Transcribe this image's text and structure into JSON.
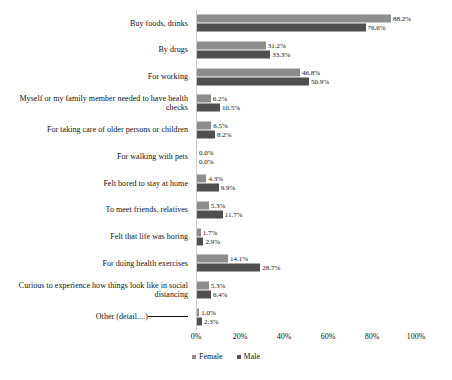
{
  "chart_data": {
    "type": "bar",
    "orientation": "horizontal",
    "title": "",
    "subtitle": "",
    "xlabel": "",
    "ylabel": "",
    "xlim": [
      0,
      100
    ],
    "xticks": [
      "0%",
      "20%",
      "40%",
      "60%",
      "80%",
      "100%"
    ],
    "xtick_values": [
      0,
      20,
      40,
      60,
      80,
      100
    ],
    "grid": false,
    "legend_position": "bottom-center",
    "value_suffix": "%",
    "categories": [
      "Other (detail....)",
      "Curious to experience how things look like in social distancing",
      "For doing health exercises",
      "Felt that life was boring",
      "To meet friends, relatives",
      "Felt bored to stay at home",
      "For walking with pets",
      "For taking care of older persons or children",
      "Myself or my family member needed to have health checks",
      "For working",
      "By drugs",
      "Buy foods, drinks"
    ],
    "series": [
      {
        "name": "Female",
        "color": "#8d8d8d",
        "values": [
          1.0,
          5.3,
          14.1,
          1.7,
          5.3,
          4.3,
          0.0,
          6.5,
          6.2,
          46.8,
          31.2,
          88.2
        ],
        "labels": [
          "1.0%",
          "5.3%",
          "14.1%",
          "1.7%",
          "5.3%",
          "4.3%",
          "0.0%",
          "6.5%",
          "6.2%",
          "46.8%",
          "31.2%",
          "88.2%"
        ]
      },
      {
        "name": "Male",
        "color": "#4f4f4f",
        "values": [
          2.3,
          6.4,
          28.7,
          2.9,
          11.7,
          9.9,
          0.0,
          8.2,
          10.5,
          50.9,
          33.3,
          76.6
        ],
        "labels": [
          "2.3%",
          "6.4%",
          "28.7%",
          "2.9%",
          "11.7%",
          "9.9%",
          "0.0%",
          "8.2%",
          "10.5%",
          "50.9%",
          "33.3%",
          "76.6%"
        ]
      }
    ]
  },
  "legend": {
    "items": [
      {
        "label": "Female",
        "color": "#8d8d8d"
      },
      {
        "label": "Male",
        "color": "#4f4f4f"
      }
    ]
  }
}
